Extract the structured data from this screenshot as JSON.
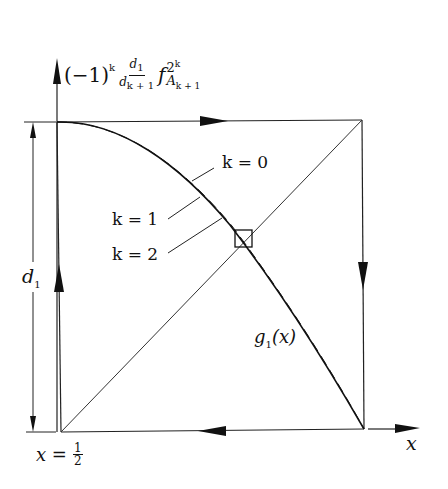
{
  "diagram": {
    "y_axis_label": {
      "prefix": "(−1)",
      "prefix_exp": "k",
      "frac_num": "d",
      "frac_num_sub": "1",
      "frac_den": "d",
      "frac_den_sub": "k + 1",
      "func": "f",
      "func_sup": "2",
      "func_sup_exp": "k",
      "func_sub": "A",
      "func_sub_sub": "k + 1"
    },
    "x_axis_label": "x",
    "origin_label": {
      "lhs": "x =",
      "num": "1",
      "den": "2"
    },
    "dimension_label": {
      "base": "d",
      "sub": "1"
    },
    "curve_labels": [
      {
        "text": "k = 0"
      },
      {
        "text": "k = 1"
      },
      {
        "text": "k = 2"
      }
    ],
    "function_label": {
      "name": "g",
      "sub": "1",
      "arg": "(x)"
    },
    "colors": {
      "ink": "#111111",
      "background": "#ffffff"
    }
  }
}
